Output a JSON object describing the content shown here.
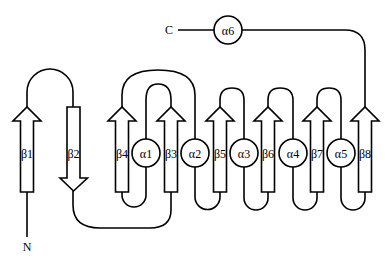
{
  "diagram": {
    "type": "protein-topology",
    "termini": {
      "n_label": "N",
      "c_label": "C"
    },
    "strands": [
      {
        "id": "b1",
        "label": "β1",
        "direction": "up"
      },
      {
        "id": "b2",
        "label": "β2",
        "direction": "down"
      },
      {
        "id": "b4",
        "label": "β4",
        "direction": "up"
      },
      {
        "id": "b3",
        "label": "β3",
        "direction": "up"
      },
      {
        "id": "b5",
        "label": "β5",
        "direction": "up"
      },
      {
        "id": "b6",
        "label": "β6",
        "direction": "up"
      },
      {
        "id": "b7",
        "label": "β7",
        "direction": "up"
      },
      {
        "id": "b8",
        "label": "β8",
        "direction": "up"
      }
    ],
    "helices": [
      {
        "id": "a1",
        "label": "α1"
      },
      {
        "id": "a2",
        "label": "α2"
      },
      {
        "id": "a3",
        "label": "α3"
      },
      {
        "id": "a4",
        "label": "α4"
      },
      {
        "id": "a5",
        "label": "α5"
      },
      {
        "id": "a6",
        "label": "α6"
      }
    ],
    "sequence_order": [
      "N",
      "β1",
      "β2",
      "β3",
      "α1",
      "β4",
      "α2",
      "β5",
      "α3",
      "β6",
      "α4",
      "β7",
      "α5",
      "β8",
      "α6",
      "C"
    ],
    "spatial_order": [
      "β1",
      "β2",
      "β4",
      "α1",
      "β3",
      "α2",
      "β5",
      "α3",
      "β6",
      "α4",
      "β7",
      "α5",
      "β8"
    ]
  }
}
